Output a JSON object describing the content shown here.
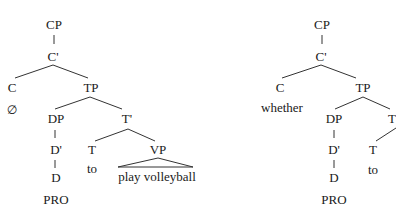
{
  "trees": [
    {
      "id": "left",
      "nodes": {
        "cp": "CP",
        "c_bar": "C'",
        "c": "C",
        "c_word": "∅",
        "tp": "TP",
        "dp": "DP",
        "t_bar": "T'",
        "d_bar": "D'",
        "d": "D",
        "d_word": "PRO",
        "t": "T",
        "t_word": "to",
        "vp": "VP",
        "vp_word": "play volleyball"
      }
    },
    {
      "id": "right",
      "nodes": {
        "cp": "CP",
        "c_bar": "C'",
        "c": "C",
        "c_word": "whether",
        "tp": "TP",
        "dp": "DP",
        "t_bar": "T",
        "d_bar": "D'",
        "d": "D",
        "d_word": "PRO",
        "t": "T",
        "t_word": "to"
      }
    }
  ],
  "colors": {
    "ink": "#1a1a1a",
    "background": "#ffffff"
  }
}
